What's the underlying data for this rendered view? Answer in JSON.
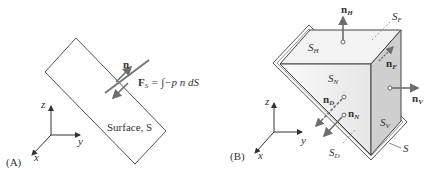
{
  "panel_a": {
    "label": "(A)",
    "normal_label": "n",
    "force_label_F": "F",
    "force_label_sub": "S",
    "force_equation": " = ∫−p n dS",
    "surface_label": "Surface, S",
    "axes": {
      "z": "z",
      "y": "y",
      "x": "x"
    }
  },
  "panel_b": {
    "label": "(B)",
    "surfaces": {
      "SH": {
        "main": "S",
        "sub": "H"
      },
      "SN": {
        "main": "S",
        "sub": "N"
      },
      "SV": {
        "main": "S",
        "sub": "V"
      },
      "SF": {
        "main": "S",
        "sub": "F"
      },
      "SD": {
        "main": "S",
        "sub": "D"
      },
      "S": "S"
    },
    "normals": {
      "nH": {
        "main": "n",
        "sub": "H"
      },
      "nF": {
        "main": "n",
        "sub": "F"
      },
      "nV": {
        "main": "n",
        "sub": "V"
      },
      "nD": {
        "main": "n",
        "sub": "D"
      },
      "nN": {
        "main": "n",
        "sub": "N"
      }
    },
    "axes": {
      "z": "z",
      "y": "y",
      "x": "x"
    }
  },
  "colors": {
    "arrow": "#6e6e6e",
    "line": "#444444",
    "face_light": "#f2f2f2",
    "face_side": "#cfcfcf"
  }
}
